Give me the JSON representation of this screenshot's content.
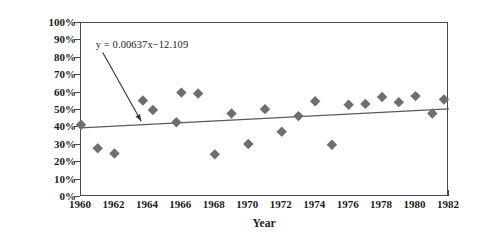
{
  "chart_data": {
    "type": "scatter",
    "title": "",
    "xlabel": "Year",
    "ylabel_line1": "Percentage of Environmental",
    "ylabel_line2": "Articles Covering Government",
    "xlim": [
      1960,
      1982
    ],
    "ylim": [
      0,
      100
    ],
    "x_ticks": [
      "1960",
      "1962",
      "1964",
      "1966",
      "1968",
      "1970",
      "1972",
      "1974",
      "1976",
      "1978",
      "1980",
      "1982"
    ],
    "x_tick_values": [
      1960,
      1962,
      1964,
      1966,
      1968,
      1970,
      1972,
      1974,
      1976,
      1978,
      1980,
      1982
    ],
    "y_ticks": [
      "0%",
      "10%",
      "20%",
      "30%",
      "40%",
      "50%",
      "60%",
      "70%",
      "80%",
      "90%",
      "100%"
    ],
    "y_tick_values": [
      0,
      10,
      20,
      30,
      40,
      50,
      60,
      70,
      80,
      90,
      100
    ],
    "grid": false,
    "legend": false,
    "marker": "diamond",
    "marker_color": "#6e6e6e",
    "axis_color": "#4a4a4a",
    "trendline_color": "#5a5a5a",
    "x": [
      1960,
      1961,
      1962,
      1963.7,
      1964.3,
      1965.7,
      1966,
      1967,
      1968,
      1969,
      1970,
      1971,
      1972,
      1973,
      1974,
      1975,
      1976,
      1977,
      1978,
      1979,
      1980,
      1981,
      1981.7
    ],
    "y": [
      41.5,
      28,
      25,
      55.5,
      50,
      43,
      60,
      59.5,
      24.5,
      48,
      30.5,
      50.5,
      37.5,
      46.5,
      55,
      30,
      53,
      53.5,
      57.5,
      54.5,
      58,
      48,
      56
    ],
    "points": [
      {
        "x": 1960,
        "y": 41.5
      },
      {
        "x": 1961,
        "y": 28
      },
      {
        "x": 1962,
        "y": 25
      },
      {
        "x": 1963.7,
        "y": 55.5
      },
      {
        "x": 1964.3,
        "y": 50
      },
      {
        "x": 1965.7,
        "y": 43
      },
      {
        "x": 1966,
        "y": 60
      },
      {
        "x": 1967,
        "y": 59.5
      },
      {
        "x": 1968,
        "y": 24.5
      },
      {
        "x": 1969,
        "y": 48
      },
      {
        "x": 1970,
        "y": 30.5
      },
      {
        "x": 1971,
        "y": 50.5
      },
      {
        "x": 1972,
        "y": 37.5
      },
      {
        "x": 1973,
        "y": 46.5
      },
      {
        "x": 1974,
        "y": 55
      },
      {
        "x": 1975,
        "y": 30
      },
      {
        "x": 1976,
        "y": 53
      },
      {
        "x": 1977,
        "y": 53.5
      },
      {
        "x": 1978,
        "y": 57.5
      },
      {
        "x": 1979,
        "y": 54.5
      },
      {
        "x": 1980,
        "y": 58
      },
      {
        "x": 1981,
        "y": 48
      },
      {
        "x": 1981.7,
        "y": 56
      }
    ],
    "trendline": {
      "equation": "y = 0.00637x−12.109",
      "x_start": 1960,
      "y_start": 39.7,
      "x_end": 1982,
      "y_end": 50.6
    },
    "annotation": {
      "text": "y = 0.00637x−12.109",
      "arrow_from": {
        "x": 1961.3,
        "y": 83.0
      },
      "arrow_to": {
        "x": 1963.6,
        "y": 43.5
      }
    }
  }
}
